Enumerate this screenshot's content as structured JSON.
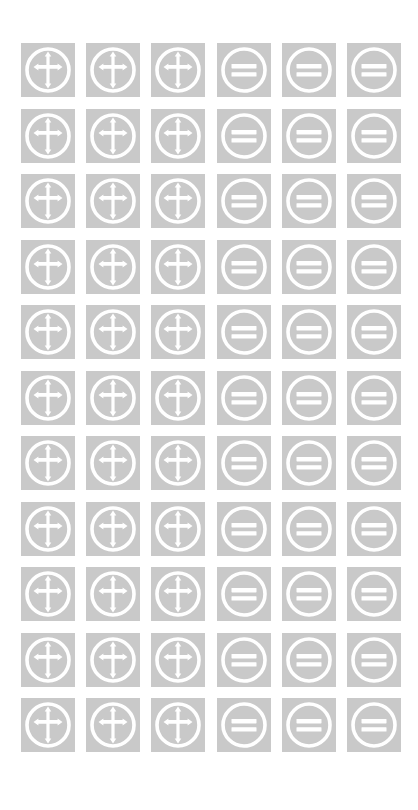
{
  "sheet": {
    "title": "Symbol Icon Sheet",
    "background_color": "#ffffff",
    "tile_color": "#c9c9c9",
    "glyph_color": "#ffffff",
    "columns": 6,
    "rows": 11,
    "tile_size_px": 54,
    "column_gap_px": 11,
    "row_gap_px": 11,
    "grid_origin": {
      "x_px": 21,
      "y_px": 43
    }
  },
  "legend": [
    {
      "column_range": "1-3",
      "icon_name": "circled-cross-icon",
      "label": "Circled Cross"
    },
    {
      "column_range": "4-6",
      "icon_name": "circled-equals-icon",
      "label": "Circled Equals"
    }
  ],
  "grid": {
    "rows": [
      {
        "cells": [
          {
            "icon": "circled-cross-icon",
            "label": "Circled Cross"
          },
          {
            "icon": "circled-cross-icon",
            "label": "Circled Cross"
          },
          {
            "icon": "circled-cross-icon",
            "label": "Circled Cross"
          },
          {
            "icon": "circled-equals-icon",
            "label": "Circled Equals"
          },
          {
            "icon": "circled-equals-icon",
            "label": "Circled Equals"
          },
          {
            "icon": "circled-equals-icon",
            "label": "Circled Equals"
          }
        ]
      },
      {
        "cells": [
          {
            "icon": "circled-cross-icon",
            "label": "Circled Cross"
          },
          {
            "icon": "circled-cross-icon",
            "label": "Circled Cross"
          },
          {
            "icon": "circled-cross-icon",
            "label": "Circled Cross"
          },
          {
            "icon": "circled-equals-icon",
            "label": "Circled Equals"
          },
          {
            "icon": "circled-equals-icon",
            "label": "Circled Equals"
          },
          {
            "icon": "circled-equals-icon",
            "label": "Circled Equals"
          }
        ]
      },
      {
        "cells": [
          {
            "icon": "circled-cross-icon",
            "label": "Circled Cross"
          },
          {
            "icon": "circled-cross-icon",
            "label": "Circled Cross"
          },
          {
            "icon": "circled-cross-icon",
            "label": "Circled Cross"
          },
          {
            "icon": "circled-equals-icon",
            "label": "Circled Equals"
          },
          {
            "icon": "circled-equals-icon",
            "label": "Circled Equals"
          },
          {
            "icon": "circled-equals-icon",
            "label": "Circled Equals"
          }
        ]
      },
      {
        "cells": [
          {
            "icon": "circled-cross-icon",
            "label": "Circled Cross"
          },
          {
            "icon": "circled-cross-icon",
            "label": "Circled Cross"
          },
          {
            "icon": "circled-cross-icon",
            "label": "Circled Cross"
          },
          {
            "icon": "circled-equals-icon",
            "label": "Circled Equals"
          },
          {
            "icon": "circled-equals-icon",
            "label": "Circled Equals"
          },
          {
            "icon": "circled-equals-icon",
            "label": "Circled Equals"
          }
        ]
      },
      {
        "cells": [
          {
            "icon": "circled-cross-icon",
            "label": "Circled Cross"
          },
          {
            "icon": "circled-cross-icon",
            "label": "Circled Cross"
          },
          {
            "icon": "circled-cross-icon",
            "label": "Circled Cross"
          },
          {
            "icon": "circled-equals-icon",
            "label": "Circled Equals"
          },
          {
            "icon": "circled-equals-icon",
            "label": "Circled Equals"
          },
          {
            "icon": "circled-equals-icon",
            "label": "Circled Equals"
          }
        ]
      },
      {
        "cells": [
          {
            "icon": "circled-cross-icon",
            "label": "Circled Cross"
          },
          {
            "icon": "circled-cross-icon",
            "label": "Circled Cross"
          },
          {
            "icon": "circled-cross-icon",
            "label": "Circled Cross"
          },
          {
            "icon": "circled-equals-icon",
            "label": "Circled Equals"
          },
          {
            "icon": "circled-equals-icon",
            "label": "Circled Equals"
          },
          {
            "icon": "circled-equals-icon",
            "label": "Circled Equals"
          }
        ]
      },
      {
        "cells": [
          {
            "icon": "circled-cross-icon",
            "label": "Circled Cross"
          },
          {
            "icon": "circled-cross-icon",
            "label": "Circled Cross"
          },
          {
            "icon": "circled-cross-icon",
            "label": "Circled Cross"
          },
          {
            "icon": "circled-equals-icon",
            "label": "Circled Equals"
          },
          {
            "icon": "circled-equals-icon",
            "label": "Circled Equals"
          },
          {
            "icon": "circled-equals-icon",
            "label": "Circled Equals"
          }
        ]
      },
      {
        "cells": [
          {
            "icon": "circled-cross-icon",
            "label": "Circled Cross"
          },
          {
            "icon": "circled-cross-icon",
            "label": "Circled Cross"
          },
          {
            "icon": "circled-cross-icon",
            "label": "Circled Cross"
          },
          {
            "icon": "circled-equals-icon",
            "label": "Circled Equals"
          },
          {
            "icon": "circled-equals-icon",
            "label": "Circled Equals"
          },
          {
            "icon": "circled-equals-icon",
            "label": "Circled Equals"
          }
        ]
      },
      {
        "cells": [
          {
            "icon": "circled-cross-icon",
            "label": "Circled Cross"
          },
          {
            "icon": "circled-cross-icon",
            "label": "Circled Cross"
          },
          {
            "icon": "circled-cross-icon",
            "label": "Circled Cross"
          },
          {
            "icon": "circled-equals-icon",
            "label": "Circled Equals"
          },
          {
            "icon": "circled-equals-icon",
            "label": "Circled Equals"
          },
          {
            "icon": "circled-equals-icon",
            "label": "Circled Equals"
          }
        ]
      },
      {
        "cells": [
          {
            "icon": "circled-cross-icon",
            "label": "Circled Cross"
          },
          {
            "icon": "circled-cross-icon",
            "label": "Circled Cross"
          },
          {
            "icon": "circled-cross-icon",
            "label": "Circled Cross"
          },
          {
            "icon": "circled-equals-icon",
            "label": "Circled Equals"
          },
          {
            "icon": "circled-equals-icon",
            "label": "Circled Equals"
          },
          {
            "icon": "circled-equals-icon",
            "label": "Circled Equals"
          }
        ]
      },
      {
        "cells": [
          {
            "icon": "circled-cross-icon",
            "label": "Circled Cross"
          },
          {
            "icon": "circled-cross-icon",
            "label": "Circled Cross"
          },
          {
            "icon": "circled-cross-icon",
            "label": "Circled Cross"
          },
          {
            "icon": "circled-equals-icon",
            "label": "Circled Equals"
          },
          {
            "icon": "circled-equals-icon",
            "label": "Circled Equals"
          },
          {
            "icon": "circled-equals-icon",
            "label": "Circled Equals"
          }
        ]
      }
    ]
  }
}
